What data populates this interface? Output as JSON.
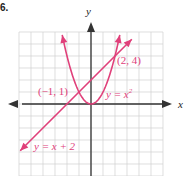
{
  "problem_number": "6.",
  "colors": {
    "curve": "#e0407a",
    "axis": "#333333",
    "grid": "#d0d0d0",
    "label": "#e0407a"
  },
  "chart_data": {
    "type": "line",
    "title": "",
    "xlabel": "x",
    "ylabel": "y",
    "xlim": [
      -6,
      6
    ],
    "ylim": [
      -6,
      6
    ],
    "grid": true,
    "grid_step": 1,
    "series": [
      {
        "name": "y = x^2",
        "label": "y = x²",
        "kind": "parabola",
        "x": [
          -2.4,
          -2,
          -1,
          0,
          1,
          2,
          2.4
        ],
        "y": [
          5.76,
          4,
          1,
          0,
          1,
          4,
          5.76
        ]
      },
      {
        "name": "y = x + 2",
        "label": "y = x + 2",
        "kind": "line",
        "x": [
          -5.9,
          -4,
          -1,
          0,
          2,
          3.4
        ],
        "y": [
          -3.9,
          -2,
          1,
          2,
          4,
          5.4
        ]
      }
    ],
    "annotations": [
      {
        "text": "(−1, 1)",
        "x": -1,
        "y": 1
      },
      {
        "text": "(2, 4)",
        "x": 2,
        "y": 4
      }
    ]
  },
  "labels": {
    "x_axis": "x",
    "y_axis": "y",
    "point_a": "(−1, 1)",
    "point_b": "(2, 4)",
    "parabola": "y = x",
    "parabola_exp": "2",
    "line": "y = x + 2"
  }
}
